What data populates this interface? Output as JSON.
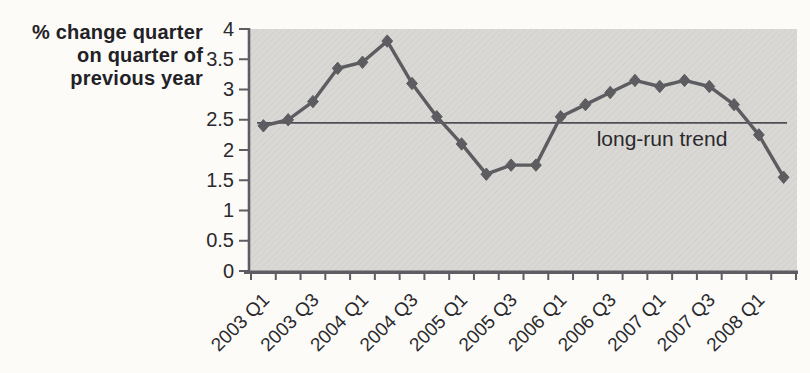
{
  "figure": {
    "y_axis_title_lines": [
      "% change quarter",
      "on quarter of",
      "previous year"
    ]
  },
  "chart_data": {
    "type": "line",
    "title": "",
    "ylabel": "% change quarter on quarter of previous year",
    "xlabel": "",
    "ylim": [
      0,
      4
    ],
    "yticks": [
      0,
      0.5,
      1,
      1.5,
      2,
      2.5,
      3,
      3.5,
      4
    ],
    "ytick_labels": [
      "0",
      "0.5",
      "1",
      "1.5",
      "2",
      "2.5",
      "3",
      "3.5",
      "4"
    ],
    "categories": [
      "2003 Q1",
      "2003 Q2",
      "2003 Q3",
      "2003 Q4",
      "2004 Q1",
      "2004 Q2",
      "2004 Q3",
      "2004 Q4",
      "2005 Q1",
      "2005 Q2",
      "2005 Q3",
      "2005 Q4",
      "2006 Q1",
      "2006 Q2",
      "2006 Q3",
      "2006 Q4",
      "2007 Q1",
      "2007 Q2",
      "2007 Q3",
      "2007 Q4",
      "2008 Q1",
      "2008 Q2"
    ],
    "x_tick_labels_shown": [
      "2003 Q1",
      "2003 Q3",
      "2004 Q1",
      "2004 Q3",
      "2005 Q1",
      "2005 Q3",
      "2006 Q1",
      "2006 Q3",
      "2007 Q1",
      "2007 Q3",
      "2008 Q1"
    ],
    "x_tick_label_indices": [
      0,
      2,
      4,
      6,
      8,
      10,
      12,
      14,
      16,
      18,
      20
    ],
    "series": [
      {
        "name": "% change quarter on quarter of previous year",
        "marker": "diamond",
        "values": [
          2.4,
          2.5,
          2.8,
          3.35,
          3.45,
          3.8,
          3.1,
          2.55,
          2.1,
          1.6,
          1.75,
          1.75,
          2.55,
          2.75,
          2.95,
          3.15,
          3.05,
          3.15,
          3.05,
          2.75,
          2.25,
          1.55
        ]
      }
    ],
    "trend_line": {
      "label": "long-run trend",
      "value": 2.45
    },
    "grid": false,
    "legend": false,
    "colors": {
      "line": "#5d5c61",
      "trend": "#4f4e54",
      "plot_bg": "#d9d8d4",
      "axis": "#5f5d63",
      "text": "#2a292d",
      "page_bg": "#fcfbf8"
    }
  }
}
